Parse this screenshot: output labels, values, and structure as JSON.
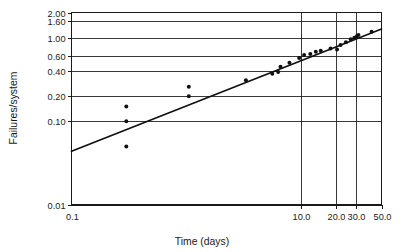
{
  "chart_data": {
    "type": "scatter",
    "title": "",
    "xlabel": "Time (days)",
    "ylabel": "Failures/system",
    "xscale": "log",
    "yscale": "log",
    "xlim": [
      0.1,
      50.0
    ],
    "ylim": [
      0.01,
      2.0
    ],
    "grid": true,
    "legend": null,
    "x_tick_labels": [
      "0.1",
      "10.0",
      "20.0",
      "30.0",
      "50.0"
    ],
    "x_tick_values": [
      0.1,
      10.0,
      20.0,
      30.0,
      50.0
    ],
    "y_tick_labels": [
      "2.00",
      "1.60",
      "1.00",
      "0.60",
      "0.40",
      "0.20",
      "0.10",
      "0.01"
    ],
    "y_tick_values": [
      2.0,
      1.6,
      1.0,
      0.6,
      0.4,
      0.2,
      0.1,
      0.01
    ],
    "gridline_x_values": [
      10.0,
      20.0,
      30.0
    ],
    "gridline_y_values": [
      1.6,
      1.0,
      0.6,
      0.4,
      0.2,
      0.1
    ],
    "series": [
      {
        "name": "Observed failures per system",
        "marker": "filled-circle",
        "color": "#111111",
        "points": [
          {
            "x": 0.3,
            "y": 0.15
          },
          {
            "x": 0.3,
            "y": 0.1
          },
          {
            "x": 0.3,
            "y": 0.05
          },
          {
            "x": 1.05,
            "y": 0.26
          },
          {
            "x": 1.05,
            "y": 0.2
          },
          {
            "x": 3.3,
            "y": 0.31
          },
          {
            "x": 5.6,
            "y": 0.37
          },
          {
            "x": 6.3,
            "y": 0.39
          },
          {
            "x": 6.6,
            "y": 0.45
          },
          {
            "x": 7.9,
            "y": 0.5
          },
          {
            "x": 9.6,
            "y": 0.57
          },
          {
            "x": 10.6,
            "y": 0.62
          },
          {
            "x": 12.0,
            "y": 0.64
          },
          {
            "x": 13.4,
            "y": 0.68
          },
          {
            "x": 14.8,
            "y": 0.7
          },
          {
            "x": 18.0,
            "y": 0.74
          },
          {
            "x": 20.5,
            "y": 0.72
          },
          {
            "x": 22.0,
            "y": 0.82
          },
          {
            "x": 24.5,
            "y": 0.88
          },
          {
            "x": 27.0,
            "y": 0.96
          },
          {
            "x": 29.0,
            "y": 1.0
          },
          {
            "x": 30.5,
            "y": 1.04
          },
          {
            "x": 31.5,
            "y": 1.08
          },
          {
            "x": 41.0,
            "y": 1.18
          }
        ]
      }
    ],
    "fit_line": {
      "name": "Fitted power-law trend line",
      "color": "#101010",
      "start": {
        "x": 0.1,
        "y": 0.044
      },
      "end": {
        "x": 50.0,
        "y": 1.27
      }
    }
  },
  "axes": {
    "y_title": "Failures/system",
    "x_title": "Time (days)"
  }
}
